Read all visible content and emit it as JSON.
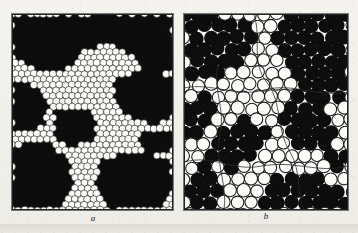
{
  "figure": {
    "background_color": "#f3f1ec",
    "panel_border_color": "#232323",
    "dark_disc_color": "#0d0d0d",
    "light_disc_color": "#fbfbf8",
    "outline_color": "#1c1c1c",
    "boundary_line_color": "#2a2a2a"
  },
  "panels": [
    {
      "id": "a",
      "label": "a",
      "x": 12,
      "y": 14,
      "width": 161,
      "height": 196,
      "disc_diameter": 7.2,
      "lattice": "hexagonal-close-packed",
      "description": "Fine-grained bubble raft: small close-packed discs, dark domains separated by light domains"
    },
    {
      "id": "b",
      "label": "b",
      "x": 184,
      "y": 14,
      "width": 164,
      "height": 196,
      "disc_diameter": 13.0,
      "lattice": "irregular-close-packed",
      "description": "Coarse-grained bubble raft: larger discs with thin curved grain-boundary traces"
    }
  ],
  "chart_data": {
    "type": "scatter",
    "title": "",
    "xlabel": "",
    "ylabel": "",
    "legend": [],
    "annotations": [
      "a",
      "b"
    ],
    "series": [
      {
        "name": "panel-a-dark-domains",
        "panel": "a",
        "fill": "#0d0d0d",
        "disc_radius": 3.6,
        "spacing_x": 6.3,
        "spacing_y": 5.45,
        "regions": [
          {
            "shape": "polygon",
            "points": [
              [
                0,
                0
              ],
              [
                161,
                0
              ],
              [
                161,
                58
              ],
              [
                132,
                62
              ],
              [
                118,
                40
              ],
              [
                96,
                30
              ],
              [
                74,
                34
              ],
              [
                62,
                52
              ],
              [
                40,
                60
              ],
              [
                18,
                52
              ],
              [
                0,
                40
              ]
            ]
          },
          {
            "shape": "polygon",
            "points": [
              [
                0,
                66
              ],
              [
                26,
                72
              ],
              [
                40,
                90
              ],
              [
                30,
                112
              ],
              [
                8,
                120
              ],
              [
                0,
                112
              ]
            ]
          },
          {
            "shape": "polygon",
            "points": [
              [
                44,
                96
              ],
              [
                72,
                92
              ],
              [
                86,
                108
              ],
              [
                80,
                128
              ],
              [
                56,
                134
              ],
              [
                40,
                120
              ]
            ]
          },
          {
            "shape": "polygon",
            "points": [
              [
                104,
                62
              ],
              [
                140,
                58
              ],
              [
                161,
                66
              ],
              [
                161,
                104
              ],
              [
                138,
                112
              ],
              [
                112,
                100
              ],
              [
                100,
                80
              ]
            ]
          },
          {
            "shape": "polygon",
            "points": [
              [
                0,
                132
              ],
              [
                34,
                126
              ],
              [
                56,
                144
              ],
              [
                62,
                170
              ],
              [
                48,
                192
              ],
              [
                18,
                196
              ],
              [
                0,
                190
              ]
            ]
          },
          {
            "shape": "polygon",
            "points": [
              [
                88,
                146
              ],
              [
                124,
                138
              ],
              [
                158,
                146
              ],
              [
                161,
                176
              ],
              [
                150,
                196
              ],
              [
                96,
                196
              ],
              [
                82,
                174
              ]
            ]
          },
          {
            "shape": "polygon",
            "points": [
              [
                130,
                118
              ],
              [
                161,
                114
              ],
              [
                161,
                136
              ],
              [
                140,
                140
              ],
              [
                126,
                132
              ]
            ]
          }
        ]
      },
      {
        "name": "panel-a-light-domains",
        "panel": "a",
        "fill": "#fbfbf8",
        "stroke": "#1c1c1c",
        "disc_radius": 3.6
      },
      {
        "name": "panel-b-dark-domains",
        "panel": "b",
        "fill": "#0d0d0d",
        "disc_radius": 6.5,
        "spacing_x": 13.4,
        "spacing_y": 11.8,
        "regions": [
          {
            "shape": "polygon",
            "points": [
              [
                0,
                0
              ],
              [
                64,
                0
              ],
              [
                72,
                18
              ],
              [
                60,
                46
              ],
              [
                34,
                64
              ],
              [
                6,
                70
              ],
              [
                0,
                54
              ]
            ]
          },
          {
            "shape": "polygon",
            "points": [
              [
                96,
                0
              ],
              [
                164,
                0
              ],
              [
                164,
                84
              ],
              [
                142,
                96
              ],
              [
                112,
                82
              ],
              [
                100,
                52
              ],
              [
                92,
                22
              ]
            ]
          },
          {
            "shape": "polygon",
            "points": [
              [
                0,
                86
              ],
              [
                20,
                80
              ],
              [
                30,
                100
              ],
              [
                18,
                122
              ],
              [
                0,
                126
              ]
            ]
          },
          {
            "shape": "polygon",
            "points": [
              [
                26,
                118
              ],
              [
                62,
                104
              ],
              [
                82,
                118
              ],
              [
                76,
                146
              ],
              [
                44,
                158
              ],
              [
                22,
                144
              ]
            ]
          },
          {
            "shape": "polygon",
            "points": [
              [
                96,
                96
              ],
              [
                134,
                88
              ],
              [
                152,
                102
              ],
              [
                148,
                128
              ],
              [
                118,
                136
              ],
              [
                98,
                122
              ]
            ]
          },
          {
            "shape": "polygon",
            "points": [
              [
                0,
                158
              ],
              [
                22,
                152
              ],
              [
                36,
                170
              ],
              [
                30,
                192
              ],
              [
                4,
                196
              ],
              [
                0,
                188
              ]
            ]
          },
          {
            "shape": "polygon",
            "points": [
              [
                74,
                168
              ],
              [
                122,
                160
              ],
              [
                150,
                172
              ],
              [
                164,
                162
              ],
              [
                164,
                196
              ],
              [
                80,
                196
              ]
            ]
          },
          {
            "shape": "polygon",
            "points": [
              [
                134,
                134
              ],
              [
                164,
                128
              ],
              [
                164,
                156
              ],
              [
                142,
                158
              ]
            ]
          }
        ]
      },
      {
        "name": "panel-b-light-domains",
        "panel": "b",
        "fill": "#fbfbf8",
        "stroke": "#1c1c1c",
        "disc_radius": 6.5
      },
      {
        "name": "panel-b-grain-boundaries",
        "panel": "b",
        "stroke": "#2a2a2a",
        "paths": [
          "M 70 0 C 78 26, 66 48, 84 70 C 98 88, 92 116, 106 138 C 118 158, 112 180, 120 196",
          "M 0 74 C 28 68, 52 84, 80 76 C 110 68, 132 84, 164 78",
          "M 0 148 C 30 140, 48 158, 78 152 C 112 146, 134 160, 164 152",
          "M 40 196 C 44 170, 30 148, 36 120 C 42 96, 28 74, 34 50"
        ]
      }
    ]
  }
}
